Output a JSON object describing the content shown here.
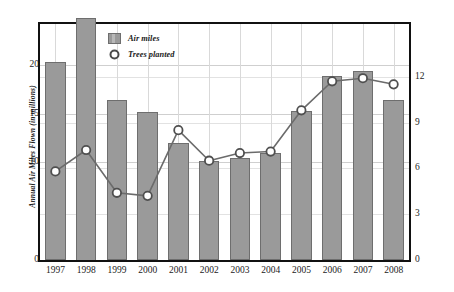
{
  "chart_data": {
    "type": "bar",
    "title": "",
    "xlabel": "",
    "ylabel": "Annual Air Miles Flown (in millions)",
    "y2label": "Trees Planted (in thousands)",
    "categories": [
      "1997",
      "1998",
      "1999",
      "2000",
      "2001",
      "2002",
      "2003",
      "2004",
      "2005",
      "2006",
      "2007",
      "2008"
    ],
    "ylim": [
      0,
      24.2
    ],
    "y2lim": [
      0,
      15.45
    ],
    "yticks": [
      0,
      10,
      15,
      20
    ],
    "y2ticks": [
      0,
      3,
      6,
      9,
      12
    ],
    "grid": true,
    "legend_position": "upper-left-inside",
    "series": [
      {
        "name": "Air miles",
        "type": "bar",
        "axis": "left",
        "units": "millions",
        "color": "#9a9a9a",
        "values": [
          20.3,
          24.8,
          16.4,
          15.2,
          12.0,
          10.2,
          10.5,
          11.0,
          15.3,
          18.9,
          19.4,
          16.4
        ],
        "note": "1998 bar exceeds the plot frame and is clipped at the top border"
      },
      {
        "name": "Trees planted",
        "type": "line",
        "axis": "right",
        "units": "thousands",
        "color": "#6b6b6b",
        "marker": "open-circle",
        "values": [
          5.8,
          7.2,
          4.4,
          4.2,
          8.5,
          6.5,
          7.0,
          7.1,
          9.8,
          11.7,
          11.9,
          11.5
        ]
      }
    ]
  },
  "legend": {
    "items": [
      {
        "label": "Air miles",
        "marker": "square-swatch"
      },
      {
        "label": "Trees planted",
        "marker": "circle-marker"
      }
    ]
  },
  "axes": {
    "left_title": "Annual Air Miles Flown (in millions)",
    "right_title": "Trees Planted (in thousands)",
    "left_ticks": [
      "0",
      "10",
      "15",
      "20"
    ],
    "right_ticks": [
      "0",
      "3",
      "6",
      "9",
      "12"
    ],
    "x_ticks": [
      "1997",
      "1998",
      "1999",
      "2000",
      "2001",
      "2002",
      "2003",
      "2004",
      "2005",
      "2006",
      "2007",
      "2008"
    ]
  },
  "colors": {
    "bar_fill": "#9a9a9a",
    "bar_stroke": "#6e6e6e",
    "line": "#6b6b6b",
    "frame": "#111111",
    "grid": "#cfcfcf",
    "text": "#1b1b1b"
  },
  "caption": {
    "text": "",
    "visible": false
  }
}
